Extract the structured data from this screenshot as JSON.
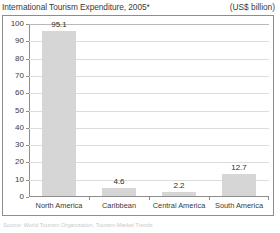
{
  "title": {
    "main": "International Tourism Expenditure, 2005*",
    "units": "(US$ billion)"
  },
  "footnote": "Source: World Tourism Organization, Tourism Market Trends",
  "colors": {
    "bar_fill": "#d6d6d6",
    "grid": "#dcdcdc",
    "axis": "#8d8d8d",
    "frame": "#8d8d8d",
    "text": "#3a3a3a"
  },
  "chart_data": {
    "type": "bar",
    "title": "International Tourism Expenditure, 2005*",
    "xlabel": "",
    "ylabel": "US$ billion",
    "ylim": [
      0,
      100
    ],
    "yticks": [
      0,
      10,
      20,
      30,
      40,
      50,
      60,
      70,
      80,
      90,
      100
    ],
    "ytick_labels": [
      "0",
      "10",
      "20",
      "30",
      "40",
      "50",
      "60",
      "70",
      "80",
      "90",
      "100"
    ],
    "grid": true,
    "legend": null,
    "categories": [
      "North America",
      "Caribbean",
      "Central America",
      "South America"
    ],
    "values": [
      95.1,
      4.6,
      2.2,
      12.7
    ],
    "value_labels": [
      "95.1",
      "4.6",
      "2.2",
      "12.7"
    ]
  }
}
